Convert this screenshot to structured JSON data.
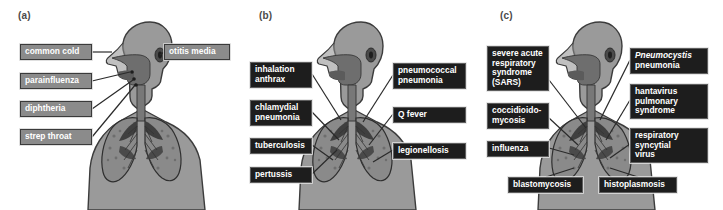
{
  "figure": {
    "caption_style": "three-panel anatomical diagram of respiratory tract infections",
    "background_color": "#ffffff"
  },
  "colors": {
    "body_fill": "#9a9a9a",
    "body_outline": "#3c3c3c",
    "airway_fill": "#6e6e6e",
    "lung_fill": "#8a8a8a",
    "lung_dark": "#3f3f3f",
    "label_gray_bg": "#8b8b8b",
    "label_dark_bg": "#1d1d1d",
    "label_text": "#ffffff",
    "leader_line": "#2a2a2a"
  },
  "panels": [
    {
      "id": "a",
      "letter": "(a)",
      "label_style": "gray",
      "figure_name": "upper-respiratory-tract-figure",
      "labels": [
        {
          "name": "common-cold",
          "text": "common cold",
          "side": "left",
          "x": 20,
          "y": 44,
          "w": 72,
          "h": 16
        },
        {
          "name": "parainfluenza",
          "text": "parainfluenza",
          "side": "left",
          "x": 20,
          "y": 73,
          "w": 72,
          "h": 16
        },
        {
          "name": "diphtheria",
          "text": "diphtheria",
          "side": "left",
          "x": 20,
          "y": 101,
          "w": 72,
          "h": 16
        },
        {
          "name": "strep-throat",
          "text": "strep throat",
          "side": "left",
          "x": 20,
          "y": 129,
          "w": 72,
          "h": 16
        },
        {
          "name": "otitis-media",
          "text": "otitis media",
          "side": "right",
          "x": 164,
          "y": 44,
          "w": 66,
          "h": 16
        }
      ]
    },
    {
      "id": "b",
      "letter": "(b)",
      "label_style": "dark",
      "figure_name": "lower-respiratory-tract-bacterial-figure",
      "labels": [
        {
          "name": "inhalation-anthrax",
          "text": "inhalation\nanthrax",
          "side": "left",
          "x": 9,
          "y": 62,
          "w": 62,
          "h": 24
        },
        {
          "name": "chlamydial-pneumonia",
          "text": "chlamydial\npneumonia",
          "side": "left",
          "x": 9,
          "y": 100,
          "w": 62,
          "h": 24
        },
        {
          "name": "tuberculosis",
          "text": "tuberculosis",
          "side": "left",
          "x": 9,
          "y": 138,
          "w": 62,
          "h": 15
        },
        {
          "name": "pertussis",
          "text": "pertussis",
          "side": "left",
          "x": 9,
          "y": 167,
          "w": 62,
          "h": 15
        },
        {
          "name": "pneumococcal-pneumonia",
          "text": "pneumococcal\npneumonia",
          "side": "right",
          "x": 152,
          "y": 63,
          "w": 73,
          "h": 24
        },
        {
          "name": "q-fever",
          "text": "Q fever",
          "side": "right",
          "x": 152,
          "y": 107,
          "w": 73,
          "h": 15
        },
        {
          "name": "legionellosis",
          "text": "legionellosis",
          "side": "right",
          "x": 152,
          "y": 143,
          "w": 73,
          "h": 15
        }
      ]
    },
    {
      "id": "c",
      "letter": "(c)",
      "label_style": "dark",
      "figure_name": "lower-respiratory-tract-viral-fungal-figure",
      "labels": [
        {
          "name": "sars",
          "text": "severe acute\nrespiratory\nsyndrome\n(SARS)",
          "side": "left",
          "x": 5,
          "y": 46,
          "w": 62,
          "h": 43
        },
        {
          "name": "coccidioidomycosis",
          "text": "coccidioido-\nmycosis",
          "side": "left",
          "x": 5,
          "y": 103,
          "w": 62,
          "h": 24
        },
        {
          "name": "influenza",
          "text": "influenza",
          "side": "left",
          "x": 5,
          "y": 141,
          "w": 62,
          "h": 15
        },
        {
          "name": "pneumocystis-pneumonia",
          "text": "Pneumocystis\npneumonia",
          "italic_first_word": true,
          "side": "right",
          "x": 148,
          "y": 48,
          "w": 78,
          "h": 24
        },
        {
          "name": "hantavirus-pulmonary-syndrome",
          "text": "hantavirus\npulmonary\nsyndrome",
          "side": "right",
          "x": 148,
          "y": 84,
          "w": 78,
          "h": 33
        },
        {
          "name": "respiratory-syncytial-virus",
          "text": "respiratory\nsyncytial\nvirus",
          "side": "right",
          "x": 148,
          "y": 128,
          "w": 78,
          "h": 33
        },
        {
          "name": "blastomycosis",
          "text": "blastomycosis",
          "side": "bottom",
          "x": 26,
          "y": 177,
          "w": 75,
          "h": 15
        },
        {
          "name": "histoplasmosis",
          "text": "histoplasmosis",
          "side": "bottom",
          "x": 117,
          "y": 177,
          "w": 78,
          "h": 15
        }
      ]
    }
  ]
}
